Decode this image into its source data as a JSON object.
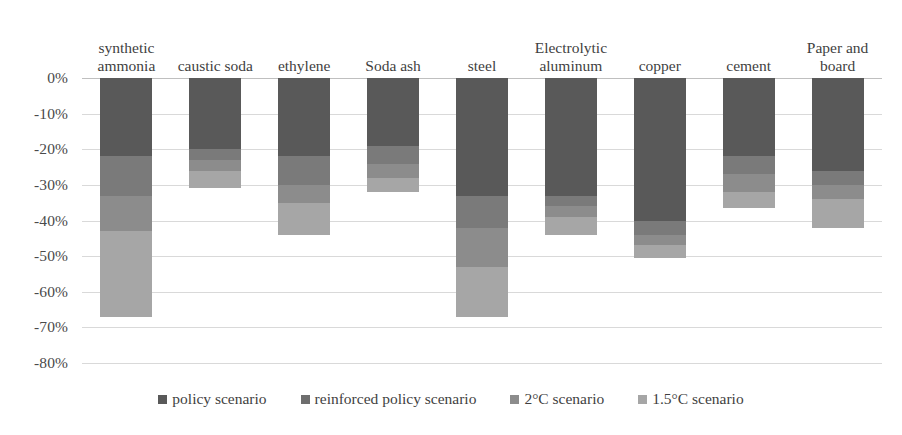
{
  "chart_data": {
    "type": "bar",
    "title": "",
    "subtitle": "",
    "xlabel": "",
    "ylabel": "",
    "ylim": [
      -80,
      0
    ],
    "grid": true,
    "legend_position": "bottom",
    "stacking": "overlaid-cumulative",
    "y_ticks": [
      "0%",
      "-10%",
      "-20%",
      "-30%",
      "-40%",
      "-50%",
      "-60%",
      "-70%",
      "-80%"
    ],
    "y_tick_values": [
      0,
      -10,
      -20,
      -30,
      -40,
      -50,
      -60,
      -70,
      -80
    ],
    "categories": [
      "synthetic\nammonia",
      "caustic soda",
      "ethylene",
      "Soda ash",
      "steel",
      "Electrolytic\naluminum",
      "copper",
      "cement",
      "Paper and\nboard"
    ],
    "series": [
      {
        "name": "policy scenario",
        "color": "#595959",
        "values": [
          -22,
          -20,
          -22,
          -19,
          -33,
          -33,
          -40,
          -22,
          -26
        ]
      },
      {
        "name": "reinforced policy scenario",
        "color": "#7a7a7a",
        "values": [
          -33,
          -23,
          -30,
          -24,
          -42,
          -36,
          -44,
          -27,
          -30
        ]
      },
      {
        "name": "2°C scenario",
        "color": "#8c8c8c",
        "values": [
          -43,
          -26,
          -35,
          -28,
          -53,
          -39,
          -47,
          -32,
          -34
        ]
      },
      {
        "name": "1.5°C scenario",
        "color": "#a6a6a6",
        "values": [
          -67,
          -31,
          -44,
          -32,
          -67,
          -44,
          -50.5,
          -36.5,
          -42
        ]
      }
    ]
  },
  "legend": {
    "items": [
      {
        "label": "policy scenario",
        "color": "#595959"
      },
      {
        "label": "reinforced policy scenario",
        "color": "#6e6e6e"
      },
      {
        "label": "2°C scenario",
        "color": "#8c8c8c"
      },
      {
        "label": "1.5°C scenario",
        "color": "#a6a6a6"
      }
    ]
  },
  "colors": {
    "gridline": "#d9d9d9",
    "zero_line": "#bfbfbf",
    "text": "#3f3f3f",
    "background": "#ffffff"
  }
}
